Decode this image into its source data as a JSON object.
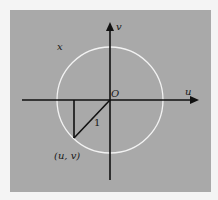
{
  "figure": {
    "background_color": "#a9a9a9",
    "circle_color": "#ffffff",
    "axis_color": "#111111",
    "labels": {
      "corner": "x",
      "v_axis": "v",
      "u_axis": "u",
      "origin": "O",
      "radius": "1",
      "point": "(u, v)"
    },
    "geometry": {
      "origin": [
        110,
        100
      ],
      "circle_radius": 53,
      "h_axis": {
        "from": [
          22,
          100
        ],
        "to": [
          198,
          100
        ]
      },
      "v_axis": {
        "from": [
          110,
          180
        ],
        "to": [
          110,
          22
        ]
      },
      "point": [
        74,
        138
      ]
    }
  }
}
